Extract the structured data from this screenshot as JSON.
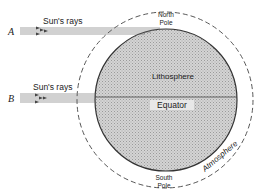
{
  "diagram": {
    "labels": {
      "ray_a_marker": "A",
      "ray_b_marker": "B",
      "ray_a_label": "Sun's rays",
      "ray_b_label": "Sun's rays",
      "north_pole_line1": "North",
      "north_pole_line2": "Pole",
      "south_pole_line1": "South",
      "south_pole_line2": "Pole",
      "lithosphere": "Lithosphere",
      "equator": "Equator",
      "atmosphere": "Atmosphere"
    },
    "colors": {
      "lithosphere_fill": "#c8c8c8",
      "outline": "#333333",
      "rays": "#555555"
    }
  }
}
